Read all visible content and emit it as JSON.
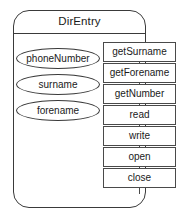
{
  "diagram": {
    "type": "uml-class-diagram",
    "class_name": "DirEntry",
    "attributes": [
      {
        "name": "phoneNumber"
      },
      {
        "name": "surname"
      },
      {
        "name": "forename"
      }
    ],
    "methods": [
      {
        "name": "getSurname"
      },
      {
        "name": "getForename"
      },
      {
        "name": "getNumber"
      },
      {
        "name": "read"
      },
      {
        "name": "write"
      },
      {
        "name": "open"
      },
      {
        "name": "close"
      }
    ],
    "colors": {
      "background": "#ffffff",
      "outline": "#3a3a3a",
      "box_outline": "#4a4a4a",
      "text": "#1a1a1a"
    }
  }
}
